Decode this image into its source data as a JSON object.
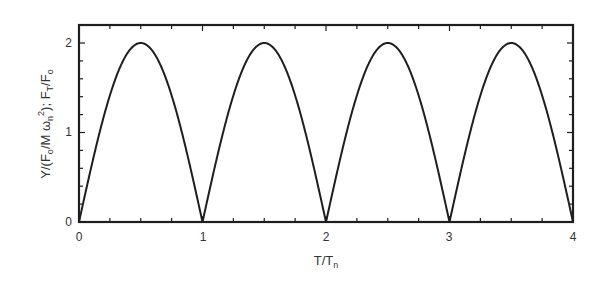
{
  "chart_data": {
    "type": "line",
    "title": "",
    "xlabel": "T/T_n",
    "ylabel": "Y/(F_o/M ω_n²); F_T/F_o",
    "xlim": [
      0,
      4
    ],
    "ylim": [
      0,
      2.2
    ],
    "xticks": [
      0,
      1,
      2,
      3,
      4
    ],
    "yticks": [
      0,
      1,
      2
    ],
    "xtick_labels": [
      "0",
      "1",
      "2",
      "3",
      "4"
    ],
    "ytick_labels": [
      "0",
      "1",
      "2"
    ],
    "x_minor_step": 0.25,
    "y_minor_step": 0.2,
    "grid": false,
    "legend": null,
    "series": [
      {
        "name": "|2 sin(π T/T_n)|",
        "x": [
          0,
          0.125,
          0.25,
          0.375,
          0.5,
          0.625,
          0.75,
          0.875,
          1.0,
          1.125,
          1.25,
          1.375,
          1.5,
          1.625,
          1.75,
          1.875,
          2.0,
          2.125,
          2.25,
          2.375,
          2.5,
          2.625,
          2.75,
          2.875,
          3.0,
          3.125,
          3.25,
          3.375,
          3.5,
          3.625,
          3.75,
          3.875,
          4.0
        ],
        "y": [
          0,
          0.77,
          1.41,
          1.85,
          2.0,
          1.85,
          1.41,
          0.77,
          0,
          0.77,
          1.41,
          1.85,
          2.0,
          1.85,
          1.41,
          0.77,
          0,
          0.77,
          1.41,
          1.85,
          2.0,
          1.85,
          1.41,
          0.77,
          0,
          0.77,
          1.41,
          1.85,
          2.0,
          1.85,
          1.41,
          0.77,
          0
        ]
      }
    ]
  },
  "labels": {
    "x_axis_main": "T/T",
    "x_axis_sub": "n",
    "y_axis": {
      "p1": "Y/(F",
      "s1": "o",
      "p2": "/M ω",
      "s2": "n",
      "sup": "2",
      "p3": "); F",
      "s3": "T",
      "p4": "/F",
      "s4": "o"
    },
    "xtick": [
      "0",
      "1",
      "2",
      "3",
      "4"
    ],
    "ytick": [
      "0",
      "1",
      "2"
    ]
  }
}
